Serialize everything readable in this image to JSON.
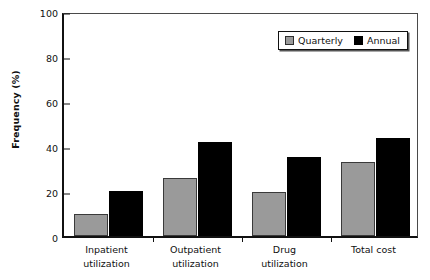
{
  "chart_data": {
    "type": "bar",
    "title": "",
    "subtitle": "",
    "xlabel": "",
    "ylabel": "Frequency (%)",
    "ylim": [
      0,
      100
    ],
    "yticks": [
      0,
      20,
      40,
      60,
      80,
      100
    ],
    "ytick_labels": [
      "0",
      "20",
      "40",
      "60",
      "80",
      "100"
    ],
    "grid": false,
    "legend_position": "top-right-inside",
    "categories": [
      "Inpatient\nutilization",
      "Outpatient\nutilization",
      "Drug\nutilization",
      "Total cost"
    ],
    "category_lines": [
      [
        "Inpatient",
        "utilization"
      ],
      [
        "Outpatient",
        "utilization"
      ],
      [
        "Drug",
        "utilization"
      ],
      [
        "Total cost"
      ]
    ],
    "series": [
      {
        "name": "Quarterly",
        "color": "#9a9a9a",
        "values": [
          10,
          26,
          19.5,
          33
        ]
      },
      {
        "name": "Annual",
        "color": "#000000",
        "values": [
          20,
          42,
          35,
          43.5
        ]
      }
    ]
  },
  "legend": {
    "entries": [
      {
        "label": "Quarterly",
        "swatch": "quarterly-swatch-icon"
      },
      {
        "label": "Annual",
        "swatch": "annual-swatch-icon"
      }
    ]
  },
  "colors": {
    "quarterly": "#9a9a9a",
    "annual": "#000000",
    "axis": "#111111",
    "background": "#ffffff"
  }
}
